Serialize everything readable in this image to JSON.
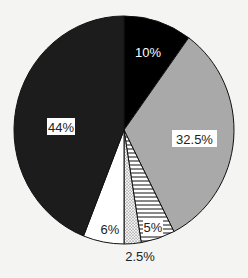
{
  "chart_data": {
    "type": "pie",
    "title": "",
    "start_angle_deg": 0,
    "direction": "clockwise",
    "slices": [
      {
        "label": "10%",
        "value": 10,
        "fill": "#000000",
        "pattern": "solid",
        "label_style": "white-text"
      },
      {
        "label": "32.5%",
        "value": 32.5,
        "fill": "#a9a9a9",
        "pattern": "solid",
        "label_style": "boxed"
      },
      {
        "label": "5%",
        "value": 5,
        "fill": "#ffffff",
        "pattern": "horizontal-hatch",
        "label_style": "boxed"
      },
      {
        "label": "2.5%",
        "value": 2.5,
        "fill": "#e8e8e8",
        "pattern": "dots",
        "label_style": "outside"
      },
      {
        "label": "6%",
        "value": 6,
        "fill": "#ffffff",
        "pattern": "solid",
        "label_style": "plain"
      },
      {
        "label": "44%",
        "value": 44,
        "fill": "#1c1c1c",
        "pattern": "solid",
        "label_style": "boxed"
      }
    ],
    "legend": null
  },
  "labels": {
    "s0": "10%",
    "s1": "32.5%",
    "s2": "5%",
    "s3": "2.5%",
    "s4": "6%",
    "s5": "44%"
  }
}
